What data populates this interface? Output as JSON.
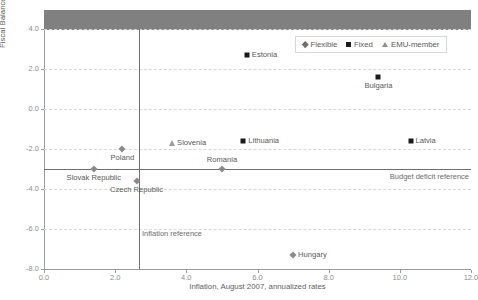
{
  "chart": {
    "title": "",
    "xlabel": "Inflation, August 2007, annualized rates",
    "ylabel": "Fiscal Balance (percentage of GDP), 2007"
  },
  "legend": {
    "items": [
      {
        "label": "Flexible",
        "icon": "diamond-marker-icon"
      },
      {
        "label": "Fixed",
        "icon": "square-marker-icon"
      },
      {
        "label": "EMU-member",
        "icon": "triangle-marker-icon"
      }
    ]
  },
  "references": {
    "deficit_label": "Budget deficit reference",
    "deficit_value": -3.0,
    "inflation_label": "Inflation reference",
    "inflation_value": 2.8
  },
  "axes": {
    "yticks": [
      "4.0",
      "2.0",
      "0.0",
      "-2.0",
      "-4.0",
      "-6.0",
      "-8.0"
    ],
    "ytick_values": [
      4.0,
      2.0,
      0.0,
      -2.0,
      -4.0,
      -6.0,
      -8.0
    ],
    "xticks": [
      "0.0",
      "2.0",
      "4.0",
      "6.0",
      "8.0",
      "10.0",
      "12.0"
    ],
    "xtick_values": [
      0.0,
      2.0,
      4.0,
      6.0,
      8.0,
      10.0,
      12.0
    ]
  },
  "chart_data": {
    "type": "scatter",
    "title": "",
    "xlabel": "Inflation, August 2007, annualized rates",
    "ylabel": "Fiscal Balance (percentage of GDP), 2007",
    "xlim": [
      0.0,
      12.0
    ],
    "ylim": [
      -8.0,
      4.0
    ],
    "grid": true,
    "legend_position": "top-right",
    "reference_lines": [
      {
        "axis": "y",
        "value": -3.0,
        "label": "Budget deficit reference"
      },
      {
        "axis": "x",
        "value": 2.8,
        "label": "Inflation reference"
      }
    ],
    "series": [
      {
        "name": "Flexible",
        "marker": "diamond",
        "points": [
          {
            "label": "Poland",
            "x": 2.2,
            "y": -2.0,
            "label_pos": "below"
          },
          {
            "label": "Slovak Republic",
            "x": 1.4,
            "y": -3.0,
            "label_pos": "below"
          },
          {
            "label": "Czech Republic",
            "x": 2.6,
            "y": -3.6,
            "label_pos": "below"
          },
          {
            "label": "Hungary",
            "x": 7.0,
            "y": -7.3,
            "label_pos": "right"
          },
          {
            "label": "Romania",
            "x": 5.0,
            "y": -3.0,
            "label_pos": "above"
          }
        ]
      },
      {
        "name": "Fixed",
        "marker": "square",
        "points": [
          {
            "label": "Estonia",
            "x": 5.7,
            "y": 2.7,
            "label_pos": "right"
          },
          {
            "label": "Bulgaria",
            "x": 9.4,
            "y": 1.6,
            "label_pos": "below"
          },
          {
            "label": "Lithuania",
            "x": 5.6,
            "y": -1.6,
            "label_pos": "right"
          },
          {
            "label": "Latvia",
            "x": 10.3,
            "y": -1.6,
            "label_pos": "right"
          }
        ]
      },
      {
        "name": "EMU-member",
        "marker": "triangle",
        "points": [
          {
            "label": "Slovenia",
            "x": 3.6,
            "y": -1.7,
            "label_pos": "right"
          }
        ]
      }
    ]
  }
}
